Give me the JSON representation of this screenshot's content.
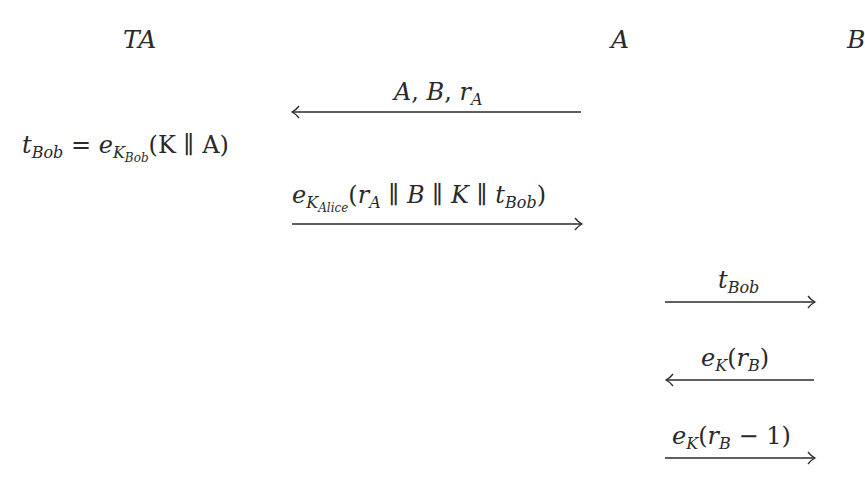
{
  "diagram": {
    "title": "",
    "parties": [
      {
        "id": "TA",
        "label": "TA"
      },
      {
        "id": "A",
        "label": "A"
      },
      {
        "id": "B",
        "label": "B"
      }
    ],
    "computations": [
      {
        "at": "TA",
        "lhs": {
          "base": "t",
          "sub": "Bob"
        },
        "equals": "=",
        "rhs": {
          "fn": "e",
          "fn_sub": "K",
          "fn_subsub": "Bob",
          "args": "(K ∥ A)"
        }
      }
    ],
    "messages": [
      {
        "from": "A",
        "to": "TA",
        "direction": "left",
        "label_parts": {
          "a": "A",
          "sep1": ", ",
          "b": "B",
          "sep2": ", ",
          "r": "r",
          "r_sub": "A"
        }
      },
      {
        "from": "TA",
        "to": "A",
        "direction": "right",
        "label_parts": {
          "fn": "e",
          "fn_sub": "K",
          "fn_subsub": "Alice",
          "open": "(",
          "r": "r",
          "r_sub": "A",
          "sep": " ∥ ",
          "b": "B",
          "k": "K",
          "t": "t",
          "t_sub": "Bob",
          "close": ")"
        }
      },
      {
        "from": "A",
        "to": "B",
        "direction": "right",
        "label_parts": {
          "t": "t",
          "t_sub": "Bob"
        }
      },
      {
        "from": "B",
        "to": "A",
        "direction": "left",
        "label_parts": {
          "fn": "e",
          "fn_sub": "K",
          "open": "(",
          "r": "r",
          "r_sub": "B",
          "close": ")"
        }
      },
      {
        "from": "A",
        "to": "B",
        "direction": "right",
        "label_parts": {
          "fn": "e",
          "fn_sub": "K",
          "open": "(",
          "r": "r",
          "r_sub": "B",
          "minus": " − 1",
          "close": ")"
        }
      }
    ],
    "colors": {
      "ink": "#2a2a2a",
      "background": "#ffffff"
    }
  }
}
